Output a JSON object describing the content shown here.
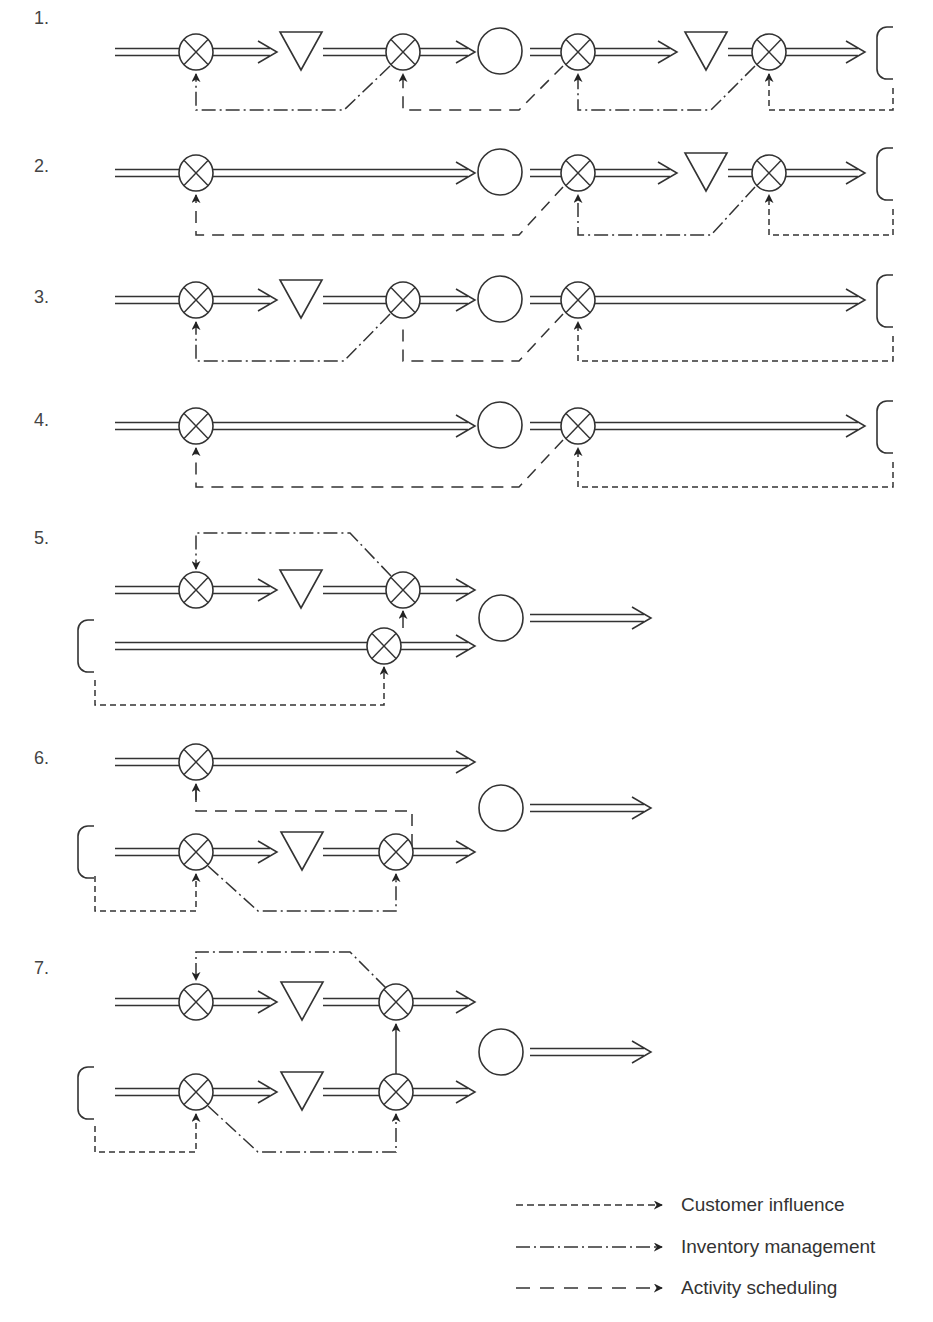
{
  "rows": [
    {
      "label": "1.",
      "y": 18
    },
    {
      "label": "2.",
      "y": 158
    },
    {
      "label": "3.",
      "y": 288
    },
    {
      "label": "4.",
      "y": 410
    },
    {
      "label": "5.",
      "y": 528
    },
    {
      "label": "6.",
      "y": 748
    },
    {
      "label": "7.",
      "y": 958
    }
  ],
  "legend": [
    {
      "label": "Customer influence",
      "style": "short-dash"
    },
    {
      "label": "Inventory management",
      "style": "dash-dot"
    },
    {
      "label": "Activity scheduling",
      "style": "long-dash"
    }
  ],
  "symbols": {
    "control_point": "circle-with-x",
    "inventory": "inverted-triangle",
    "activity": "circle",
    "customer": "c-shape",
    "flow": "double-line-arrow"
  },
  "colors": {
    "stroke": "#333333",
    "background": "#ffffff"
  }
}
